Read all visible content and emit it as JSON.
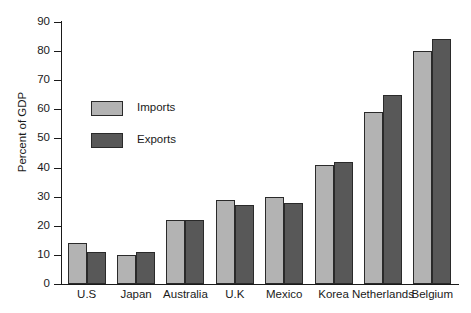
{
  "chart_data": {
    "type": "bar",
    "title": "",
    "xlabel": "",
    "ylabel": "Percent of GDP",
    "ylim": [
      0,
      90
    ],
    "ytick_step": 10,
    "yticks": [
      90,
      80,
      70,
      60,
      50,
      40,
      30,
      20,
      10,
      0
    ],
    "grid": false,
    "legend_position": "upper-left-inside",
    "categories": [
      "U.S",
      "Japan",
      "Australia",
      "U.K",
      "Mexico",
      "Korea",
      "Netherlands",
      "Belgium"
    ],
    "series": [
      {
        "name": "Imports",
        "color": "#b3b3b3",
        "values": [
          14,
          10,
          22,
          29,
          30,
          41,
          59,
          80
        ]
      },
      {
        "name": "Exports",
        "color": "#585858",
        "values": [
          11,
          11,
          22,
          27,
          28,
          42,
          65,
          84
        ]
      }
    ]
  },
  "legend": {
    "items": [
      {
        "label": "Imports",
        "color": "#b3b3b3"
      },
      {
        "label": "Exports",
        "color": "#585858"
      }
    ]
  },
  "axis": {
    "y_title": "Percent of GDP"
  }
}
